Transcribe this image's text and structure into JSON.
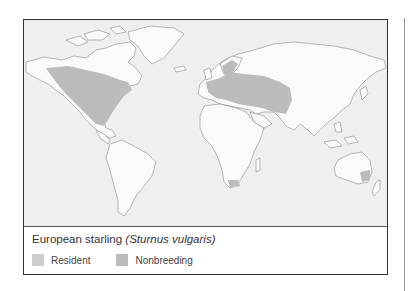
{
  "figure": {
    "caption": {
      "common_name": "European starling",
      "scientific_name": "(Sturnus vulgaris)"
    },
    "legend": [
      {
        "label": "Resident",
        "color": "#cdcdcd"
      },
      {
        "label": "Nonbreeding",
        "color": "#bcbcbc"
      }
    ],
    "map": {
      "ocean_color": "#efefef",
      "land_color": "#fafafa",
      "range_color": "#bcbcbc",
      "outline_color": "#8a8a8a",
      "range_regions": [
        "North America",
        "Europe and western Asia",
        "Southern Africa",
        "Southeastern Australia"
      ]
    }
  }
}
